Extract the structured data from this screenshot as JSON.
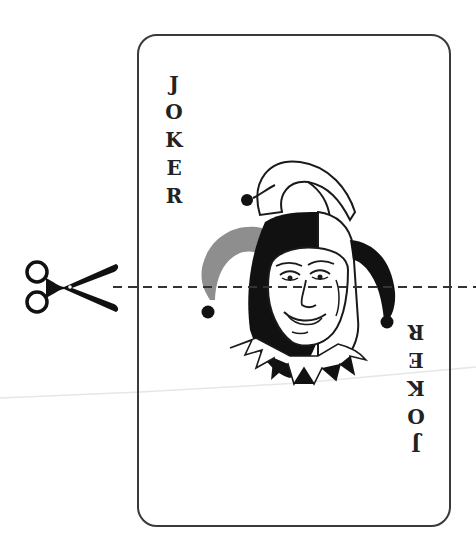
{
  "card": {
    "title": "Joker",
    "top_label": [
      "J",
      "O",
      "K",
      "E",
      "R"
    ],
    "bottom_label": [
      "J",
      "O",
      "K",
      "E",
      "R"
    ],
    "bottom_label_orientation": "rotated-180"
  },
  "illustration": {
    "subject": "jester-face-icon",
    "colors": {
      "black": "#111111",
      "gray": "#8e8e8e",
      "white": "#ffffff",
      "outline": "#1a1a1a"
    }
  },
  "cut_guide": {
    "icon": "scissors-icon",
    "line_style": "dashed",
    "color": "#333333"
  },
  "colors": {
    "background": "#ffffff",
    "card_border": "#3a3a3a",
    "text": "#222222"
  }
}
